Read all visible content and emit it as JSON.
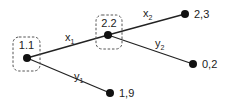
{
  "diagram": {
    "type": "game-tree",
    "decision_nodes": [
      {
        "id": "n1",
        "label": "1.1"
      },
      {
        "id": "n2",
        "label": "2.2"
      }
    ],
    "edges": [
      {
        "from": "n1",
        "to": "n2",
        "label": "x",
        "subscript": "1"
      },
      {
        "from": "n1",
        "to": "t3",
        "label": "y",
        "subscript": "1"
      },
      {
        "from": "n2",
        "to": "t1",
        "label": "x",
        "subscript": "2"
      },
      {
        "from": "n2",
        "to": "t2",
        "label": "y",
        "subscript": "2"
      }
    ],
    "terminal_nodes": [
      {
        "id": "t1",
        "payoff": "2,3"
      },
      {
        "id": "t2",
        "payoff": "0,2"
      },
      {
        "id": "t3",
        "payoff": "1,9"
      }
    ]
  }
}
